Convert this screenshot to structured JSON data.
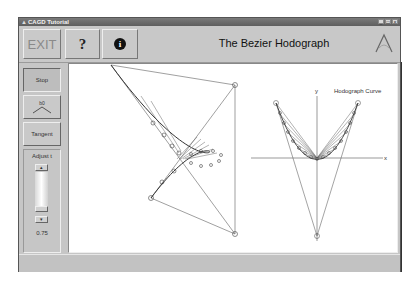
{
  "window": {
    "title": "CAGD Tutorial",
    "controls": [
      "minimize",
      "maximize",
      "close"
    ]
  },
  "toolbar": {
    "exit_label": "EXIT",
    "help_label": "?",
    "info_label": "i",
    "app_title": "The Bezier Hodograph",
    "logo_icon": "cagd-logo-icon"
  },
  "left_panel": {
    "stop_label": "Stop",
    "hodograph_button_label": "b0",
    "tangent_label": "Tangent",
    "adjust": {
      "label": "Adjust t",
      "value": "0.75",
      "up_arrow": "▴",
      "down_arrow": "▾"
    }
  },
  "canvas": {
    "hodograph_label": "Hodograph Curve",
    "axis_x": "x",
    "axis_y": "y",
    "bezier_control_points": [
      [
        110,
        64
      ],
      [
        234,
        84
      ],
      [
        234,
        233
      ],
      [
        150,
        197
      ]
    ],
    "hodograph_vertices": [
      [
        275,
        102
      ],
      [
        357,
        102
      ],
      [
        316,
        235
      ]
    ],
    "hodograph_origin": [
      316,
      157
    ]
  },
  "colors": {
    "chrome": "#c6c6c6",
    "titlebar": "#6a6a6a",
    "canvas": "#ffffff",
    "lines": "#555555"
  }
}
